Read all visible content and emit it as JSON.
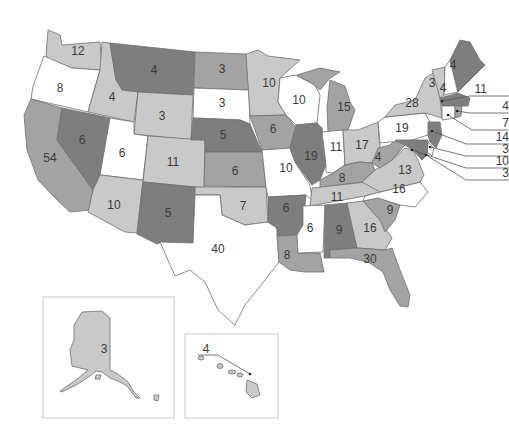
{
  "map": {
    "title": "",
    "colors": {
      "white": "#ffffff",
      "light": "#c9c9c9",
      "medium": "#a3a3a3",
      "dark": "#7e7e7e",
      "stroke": "#6f6f6f"
    },
    "states": [
      {
        "abbr": "WA",
        "votes": "12",
        "shade": "light"
      },
      {
        "abbr": "OR",
        "votes": "8",
        "shade": "white"
      },
      {
        "abbr": "CA",
        "votes": "54",
        "shade": "medium"
      },
      {
        "abbr": "NV",
        "votes": "6",
        "shade": "dark"
      },
      {
        "abbr": "ID",
        "votes": "4",
        "shade": "light"
      },
      {
        "abbr": "MT",
        "votes": "4",
        "shade": "dark"
      },
      {
        "abbr": "WY",
        "votes": "3",
        "shade": "light"
      },
      {
        "abbr": "UT",
        "votes": "6",
        "shade": "white"
      },
      {
        "abbr": "AZ",
        "votes": "11",
        "shade": "light"
      },
      {
        "abbr": "CO",
        "votes": "10",
        "shade": "light"
      },
      {
        "abbr": "NM",
        "votes": "5",
        "shade": "dark"
      },
      {
        "abbr": "ND",
        "votes": "3",
        "shade": "medium"
      },
      {
        "abbr": "SD",
        "votes": "3",
        "shade": "white"
      },
      {
        "abbr": "NE",
        "votes": "5",
        "shade": "dark"
      },
      {
        "abbr": "KS",
        "votes": "6",
        "shade": "medium"
      },
      {
        "abbr": "OK",
        "votes": "7",
        "shade": "light"
      },
      {
        "abbr": "TX",
        "votes": "40",
        "shade": "white"
      },
      {
        "abbr": "MN",
        "votes": "10",
        "shade": "light"
      },
      {
        "abbr": "IA",
        "votes": "6",
        "shade": "medium"
      },
      {
        "abbr": "MO",
        "votes": "10",
        "shade": "white"
      },
      {
        "abbr": "AR",
        "votes": "6",
        "shade": "dark"
      },
      {
        "abbr": "LA",
        "votes": "8",
        "shade": "medium"
      },
      {
        "abbr": "WI",
        "votes": "10",
        "shade": "white"
      },
      {
        "abbr": "IL",
        "votes": "19",
        "shade": "dark"
      },
      {
        "abbr": "MI",
        "votes": "15",
        "shade": "medium"
      },
      {
        "abbr": "IN",
        "votes": "11",
        "shade": "white"
      },
      {
        "abbr": "OH",
        "votes": "17",
        "shade": "light"
      },
      {
        "abbr": "KY",
        "votes": "8",
        "shade": "medium"
      },
      {
        "abbr": "TN",
        "votes": "11",
        "shade": "light"
      },
      {
        "abbr": "MS",
        "votes": "6",
        "shade": "white"
      },
      {
        "abbr": "AL",
        "votes": "9",
        "shade": "dark"
      },
      {
        "abbr": "GA",
        "votes": "16",
        "shade": "light"
      },
      {
        "abbr": "FL",
        "votes": "30",
        "shade": "medium"
      },
      {
        "abbr": "SC",
        "votes": "9",
        "shade": "medium"
      },
      {
        "abbr": "NC",
        "votes": "16",
        "shade": "white"
      },
      {
        "abbr": "VA",
        "votes": "13",
        "shade": "light"
      },
      {
        "abbr": "WV",
        "votes": "4",
        "shade": "medium"
      },
      {
        "abbr": "PA",
        "votes": "19",
        "shade": "white"
      },
      {
        "abbr": "NY",
        "votes": "28",
        "shade": "light"
      },
      {
        "abbr": "VT",
        "votes": "3",
        "shade": "light"
      },
      {
        "abbr": "NH",
        "votes": "4",
        "shade": "white"
      },
      {
        "abbr": "ME",
        "votes": "4",
        "shade": "dark"
      },
      {
        "abbr": "MA",
        "votes": "11",
        "shade": "dark"
      },
      {
        "abbr": "RI",
        "votes": "4",
        "shade": "medium"
      },
      {
        "abbr": "CT",
        "votes": "7",
        "shade": "white"
      },
      {
        "abbr": "NJ",
        "votes": "14",
        "shade": "dark"
      },
      {
        "abbr": "DE",
        "votes": "3",
        "shade": "white"
      },
      {
        "abbr": "MD",
        "votes": "10",
        "shade": "dark"
      },
      {
        "abbr": "DC",
        "votes": "3",
        "shade": "white"
      },
      {
        "abbr": "AK",
        "votes": "3",
        "shade": "light"
      },
      {
        "abbr": "HI",
        "votes": "4",
        "shade": "light"
      }
    ],
    "callouts": [
      {
        "abbr": "MA",
        "votes": "11"
      },
      {
        "abbr": "RI",
        "votes": "4"
      },
      {
        "abbr": "CT",
        "votes": "7"
      },
      {
        "abbr": "NJ",
        "votes": "14"
      },
      {
        "abbr": "DE",
        "votes": "3"
      },
      {
        "abbr": "MD",
        "votes": "10"
      },
      {
        "abbr": "DC",
        "votes": "3"
      }
    ],
    "insets": {
      "alaska": {
        "votes": "3"
      },
      "hawaii": {
        "votes": "4"
      }
    }
  }
}
